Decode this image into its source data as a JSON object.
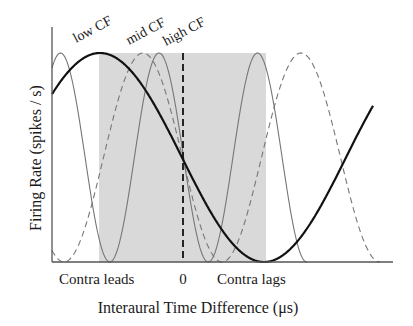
{
  "figure": {
    "ylabel": "Firing Rate (spikes / s)",
    "xlabel": "Interaural Time Difference (μs)",
    "x_ticks": {
      "left": "Contra leads",
      "center": "0",
      "right": "Contra lags"
    },
    "curve_labels": {
      "low": "low CF",
      "mid": "mid CF",
      "high": "high CF"
    },
    "colors": {
      "axis": "#555555",
      "shade": "#d9d9d9",
      "low_cf": "#111111",
      "mid_cf": "#777777",
      "high_cf": "#777777",
      "zero_line": "#111111"
    }
  },
  "chart_data": {
    "type": "line",
    "title": "",
    "xlabel": "Interaural Time Difference (μs)",
    "ylabel": "Firing Rate (spikes / s)",
    "x_tick_labels": [
      "Contra leads",
      "0",
      "Contra lags"
    ],
    "shaded_region": {
      "description": "physiological ITD range",
      "x_start_px": 99,
      "x_end_px": 266
    },
    "common_crossing": {
      "x": "0",
      "note": "all curves cross at ITD = 0"
    },
    "series": [
      {
        "name": "low CF",
        "style": "solid thick black",
        "period_px": 328,
        "peak_px": 100
      },
      {
        "name": "mid CF",
        "style": "dashed gray",
        "period_px": 158,
        "peak_px": 143
      },
      {
        "name": "high CF",
        "style": "solid thin gray",
        "period_px": 98.5,
        "peak_px": 159
      }
    ],
    "grid": false,
    "legend": "inline labels above curves"
  }
}
